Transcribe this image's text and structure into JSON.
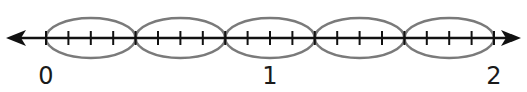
{
  "number_line": {
    "start": 0,
    "end": 2,
    "labels": [
      {
        "value": 0,
        "text": "0"
      },
      {
        "value": 1,
        "text": "1"
      },
      {
        "value": 2,
        "text": "2"
      }
    ],
    "tick_step": 0.1,
    "group_size": 4,
    "group_count": 5,
    "group_width": 0.4,
    "arrows": "both"
  },
  "colors": {
    "line": "#111111",
    "oval": "#7a7a7a",
    "label": "#1a1a1a"
  }
}
